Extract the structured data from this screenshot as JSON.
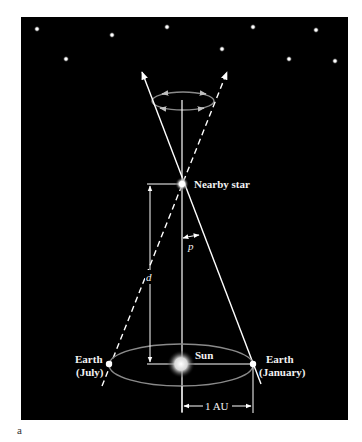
{
  "figure": {
    "caption": "a",
    "colors": {
      "background": "#000000",
      "line": "#ffffff",
      "orbit": "#8a8a8a",
      "label": "#f2f2f2"
    }
  },
  "labels": {
    "nearby_star": "Nearby star",
    "parallax_angle": "p",
    "distance": "d",
    "sun": "Sun",
    "earth_july_line1": "Earth",
    "earth_july_line2": "(July)",
    "earth_january_line1": "Earth",
    "earth_january_line2": "(January)",
    "au": "1 AU"
  },
  "background_stars": [
    {
      "x": 37,
      "y": 29
    },
    {
      "x": 112,
      "y": 35
    },
    {
      "x": 66,
      "y": 59
    },
    {
      "x": 167,
      "y": 27
    },
    {
      "x": 253,
      "y": 27
    },
    {
      "x": 316,
      "y": 30
    },
    {
      "x": 222,
      "y": 49
    },
    {
      "x": 289,
      "y": 59
    },
    {
      "x": 335,
      "y": 61
    }
  ]
}
